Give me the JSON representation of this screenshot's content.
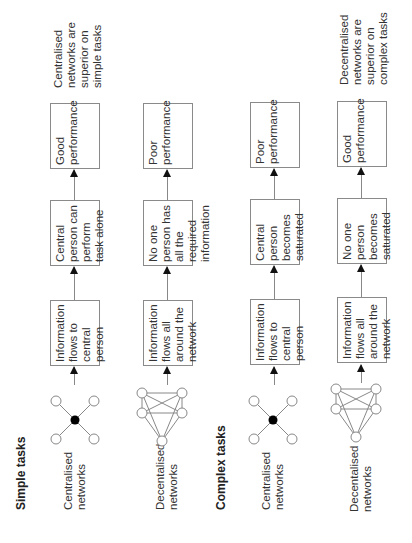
{
  "sections": {
    "simple": "Simple tasks",
    "complex": "Complex tasks"
  },
  "rows": [
    {
      "network_label": "Centralised\nnetworks",
      "network_type": "centralised",
      "step1": "Information flows to central person",
      "step2": "Central person can perform task alone",
      "outcome": "Good performance",
      "conclusion": "Centralised\nnetworks are\nsuperior on\nsimple tasks"
    },
    {
      "network_label": "Decentalised\nnetworks",
      "network_type": "decentralised",
      "step1": "Information flows all around the network",
      "step2": "No one person has all the required information",
      "outcome": "Poor performance",
      "conclusion": ""
    },
    {
      "network_label": "Centralised\nnetworks",
      "network_type": "centralised",
      "step1": "Information flows to central person",
      "step2": "Central person becomes saturated",
      "outcome": "Poor performance",
      "conclusion": ""
    },
    {
      "network_label": "Decentalised\nnetworks",
      "network_type": "decentralised",
      "step1": "Information flows all around the network",
      "step2": "No one person becomes saturated",
      "outcome": "Good performance",
      "conclusion": "Decentralised\nnetworks are\nsuperior on\ncomplex tasks"
    }
  ],
  "colors": {
    "line": "#888888",
    "node_fill": "#ffffff",
    "central_node": "#000000",
    "arrowhead": "#111111"
  }
}
